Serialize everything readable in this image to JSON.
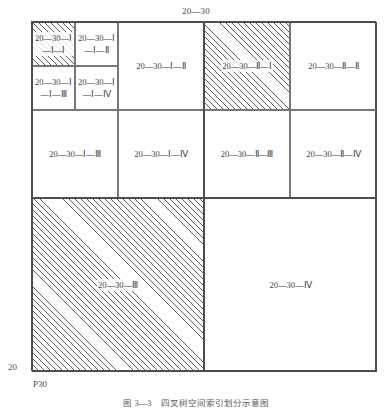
{
  "figure": {
    "top_label": "20—30",
    "axis_left_label": "20",
    "axis_origin_label": "P30",
    "caption": "图 3—3　四叉树空间索引划分示意图"
  },
  "colors": {
    "line": "#4d4d4d",
    "thin_line": "#77767a",
    "hatch": "#5c5c5c",
    "text": "#3f3f3f",
    "background": "#ffffff"
  },
  "quadrants": {
    "q1": {
      "sub": {
        "c1": "20—30—Ⅰ—Ⅰ—Ⅰ",
        "c2": "20—30—Ⅰ—Ⅰ—Ⅱ",
        "c3": "20—30—Ⅰ—Ⅰ—Ⅲ",
        "c4": "20—30—Ⅰ—Ⅰ—Ⅳ"
      },
      "c2": "20—30—Ⅰ—Ⅱ",
      "c3": "20—30—Ⅰ—Ⅲ",
      "c4": "20—30—Ⅰ—Ⅳ"
    },
    "q2": {
      "c1": "20—30—Ⅱ—Ⅰ",
      "c2": "20—30—Ⅱ—Ⅱ",
      "c3": "20—30—Ⅱ—Ⅲ",
      "c4": "20—30—Ⅱ—Ⅳ"
    },
    "q3": "20—30—Ⅲ",
    "q4": "20—30—Ⅳ"
  }
}
